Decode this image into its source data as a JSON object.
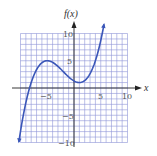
{
  "chart_data": {
    "type": "line",
    "title": "",
    "xlabel": "x",
    "ylabel": "f(x)",
    "xlim": [
      -10,
      10
    ],
    "ylim": [
      -10,
      10
    ],
    "grid": true,
    "grid_step": 1,
    "x_ticks": [
      -5,
      5,
      10
    ],
    "x_tick_labels": [
      "−5",
      "5",
      "10"
    ],
    "y_ticks": [
      10,
      5,
      -5,
      -10
    ],
    "y_tick_labels": [
      "10",
      "5",
      "−5",
      "−10"
    ],
    "series": [
      {
        "name": "f(x)",
        "description": "cubic with local max near (-5, 5) and local min near (1, 1); arrows at both ends",
        "x": [
          -10.3,
          -9,
          -8,
          -7,
          -6,
          -5,
          -4,
          -3,
          -2,
          -1,
          0,
          1,
          2,
          3,
          4,
          5,
          5.6
        ],
        "y": [
          -9.9,
          -4.4,
          -1.2,
          2.0,
          4.3,
          5.0,
          4.5,
          3.3,
          2.2,
          1.6,
          1.3,
          1.0,
          1.5,
          3.0,
          5.5,
          9.2,
          11.7
        ]
      }
    ],
    "colors": {
      "curve": "#3a56b8",
      "grid": "#8e95d6",
      "axis": "#222222"
    }
  },
  "labels": {
    "y_axis": "f(x)",
    "x_axis": "x",
    "x_ticks": [
      "−5",
      "5",
      "10"
    ],
    "y_ticks": [
      "10",
      "5",
      "−5",
      "−10"
    ]
  }
}
